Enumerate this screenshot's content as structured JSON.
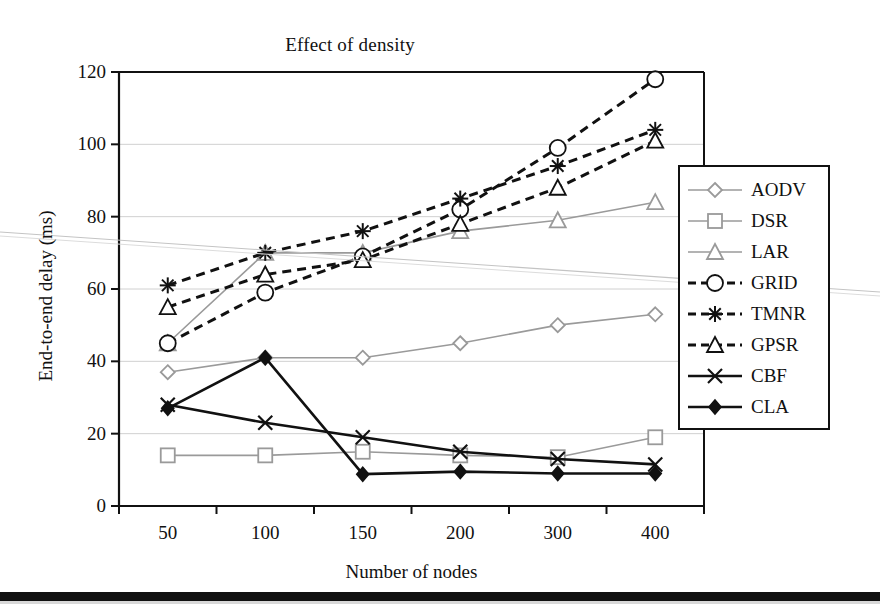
{
  "chart_data": {
    "type": "line",
    "title": "Effect of density",
    "xlabel": "Number of nodes",
    "ylabel": "End-to-end delay (ms)",
    "categories": [
      "50",
      "100",
      "150",
      "200",
      "300",
      "400"
    ],
    "ylim": [
      0,
      120
    ],
    "yticks": [
      "0",
      "20",
      "40",
      "60",
      "80",
      "100",
      "120"
    ],
    "grid": true,
    "legend_position": "right-inside",
    "series": [
      {
        "name": "AODV",
        "marker": "diamond-open",
        "line": "solid",
        "color": "#9a9a9a",
        "values": [
          37,
          41,
          41,
          45,
          50,
          53
        ]
      },
      {
        "name": "DSR",
        "marker": "square-open",
        "line": "solid",
        "color": "#9a9a9a",
        "values": [
          14,
          14,
          15,
          14,
          13.5,
          19
        ]
      },
      {
        "name": "LAR",
        "marker": "triangle-open",
        "line": "solid",
        "color": "#9a9a9a",
        "values": [
          45,
          70,
          70,
          76,
          79,
          84
        ]
      },
      {
        "name": "GRID",
        "marker": "circle-open",
        "line": "dashed",
        "color": "#111111",
        "values": [
          45,
          59,
          69,
          82,
          99,
          118
        ]
      },
      {
        "name": "TMNR",
        "marker": "asterisk",
        "line": "dashed",
        "color": "#111111",
        "values": [
          61,
          70,
          76,
          85,
          94,
          104
        ]
      },
      {
        "name": "GPSR",
        "marker": "triangle-open",
        "line": "dashed",
        "color": "#111111",
        "values": [
          55,
          64,
          68,
          78,
          88,
          101
        ]
      },
      {
        "name": "CBF",
        "marker": "cross-x",
        "line": "solid",
        "color": "#111111",
        "values": [
          28,
          23,
          19,
          15,
          13,
          11.5
        ]
      },
      {
        "name": "CLA",
        "marker": "diamond-filled",
        "line": "solid",
        "color": "#111111",
        "values": [
          27,
          41,
          8.8,
          9.5,
          9,
          9
        ]
      }
    ]
  },
  "legend": {
    "items": [
      {
        "label": "AODV"
      },
      {
        "label": "DSR"
      },
      {
        "label": "LAR"
      },
      {
        "label": "GRID"
      },
      {
        "label": "TMNR"
      },
      {
        "label": "GPSR"
      },
      {
        "label": "CBF"
      },
      {
        "label": "CLA"
      }
    ]
  },
  "colors": {
    "gray_series": "#9a9a9a",
    "black_series": "#111111",
    "gridline": "#d0d0d0",
    "axis": "#111111"
  }
}
